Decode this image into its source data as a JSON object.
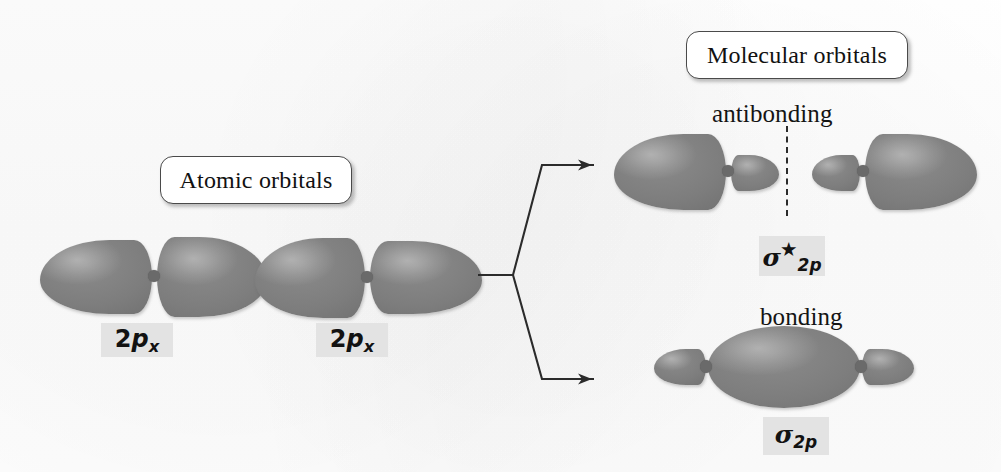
{
  "figure": {
    "kind": "molecular-orbital-diagram",
    "lobe_color": "#7d7d7d",
    "line_color": "#2b2b2b",
    "highlight_color": "#e3e3e3",
    "background_color": "#fdfdfd"
  },
  "callouts": {
    "atomic": "Atomic orbitals",
    "molecular": "Molecular orbitals"
  },
  "labels": {
    "antibonding": "antibonding",
    "bonding": "bonding"
  },
  "atomic_orbitals": [
    {
      "symbol_base": "2p",
      "symbol_sub": "x"
    },
    {
      "symbol_base": "2p",
      "symbol_sub": "x"
    }
  ],
  "molecular_orbitals": [
    {
      "name": "antibonding",
      "sigma": "σ",
      "star": "★",
      "sub": "2p",
      "has_nodal_plane": true
    },
    {
      "name": "bonding",
      "sigma": "σ",
      "star": "",
      "sub": "2p",
      "has_nodal_plane": false
    }
  ],
  "connector": {
    "stem": "horizontal line from atomic orbitals to branch vertex",
    "branches": 2,
    "arrowheads": 2
  }
}
